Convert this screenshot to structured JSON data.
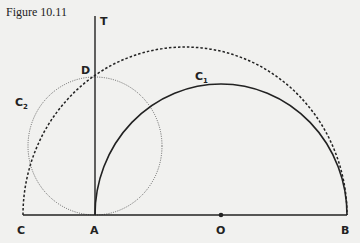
{
  "figure": {
    "title": "Figure 10.11"
  },
  "labels": {
    "T": "T",
    "D": "D",
    "C1": "C",
    "C1_sub": "1",
    "C2": "C",
    "C2_sub": "2",
    "C": "C",
    "A": "A",
    "O": "O",
    "B": "B"
  },
  "geometry": {
    "baseline": {
      "x1": 23,
      "x2": 347,
      "y": 215
    },
    "tangent_line": {
      "x": 95,
      "y1": 16,
      "y2": 215
    },
    "circle_C1": {
      "cx": 221,
      "cy": 215,
      "rx": 126,
      "ry": 131,
      "style": "solid semicircle"
    },
    "circle_C2": {
      "cx": 95,
      "cy": 146,
      "rx": 67,
      "ry": 69,
      "style": "dotted full circle"
    },
    "dashed_arc": {
      "cx": 185,
      "cy": 215,
      "rx": 162,
      "ry": 168,
      "style": "dashed semicircle"
    },
    "point_O": {
      "x": 221,
      "y": 215
    }
  },
  "colors": {
    "background": "#f1f1ef",
    "ink": "#222222"
  }
}
